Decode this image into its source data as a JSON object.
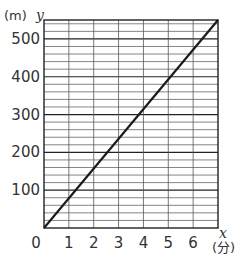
{
  "chart_data": {
    "type": "line",
    "title": "",
    "xlabel": "x (分)",
    "ylabel": "y (m)",
    "x_unit": "(分)",
    "y_unit": "(m)",
    "x_var": "x",
    "y_var": "y",
    "xlim": [
      0,
      7
    ],
    "ylim": [
      0,
      550
    ],
    "x_ticks": [
      "0",
      "1",
      "2",
      "3",
      "4",
      "5",
      "6"
    ],
    "y_ticks": [
      "100",
      "200",
      "300",
      "400",
      "500"
    ],
    "grid": true,
    "grid_minor_y_step": 20,
    "series": [
      {
        "name": "distance",
        "x": [
          0,
          7
        ],
        "y": [
          0,
          550
        ]
      }
    ],
    "colors": {
      "line": "#1a1a1a",
      "grid": "#555555",
      "axis": "#222222"
    }
  }
}
